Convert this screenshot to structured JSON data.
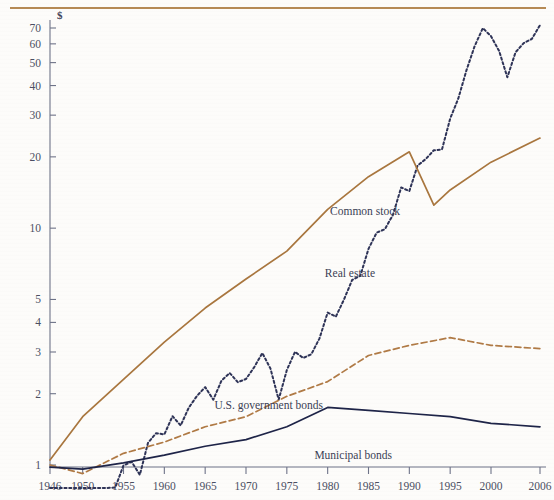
{
  "chart_data": {
    "type": "line",
    "title": "",
    "subtitle": "",
    "xlabel": "",
    "ylabel": "",
    "y_unit": "$",
    "yscale": "log",
    "ylim": [
      0.78,
      78
    ],
    "xlim": [
      1946,
      2006
    ],
    "grid": false,
    "legend_position": "inline-annotations",
    "ytick_labels": [
      "1",
      "2",
      "3",
      "4",
      "5",
      "10",
      "20",
      "30",
      "40",
      "50",
      "60",
      "70"
    ],
    "ytick_values": [
      1,
      2,
      3,
      4,
      5,
      10,
      20,
      30,
      40,
      50,
      60,
      70
    ],
    "xtick_labels": [
      "1946",
      "1950",
      "1955",
      "1960",
      "1965",
      "1970",
      "1975",
      "1980",
      "1985",
      "1990",
      "1995",
      "2000",
      "2006"
    ],
    "xtick_values": [
      1946,
      1950,
      1955,
      1960,
      1965,
      1970,
      1975,
      1980,
      1985,
      1990,
      1995,
      2000,
      2006
    ],
    "series": [
      {
        "name": "Common stock",
        "label": "Common stock",
        "color": "#2e3357",
        "style": "dotted",
        "x": [
          1946,
          1947,
          1948,
          1949,
          1950,
          1951,
          1952,
          1953,
          1954,
          1955,
          1956,
          1957,
          1958,
          1959,
          1960,
          1961,
          1962,
          1963,
          1964,
          1965,
          1966,
          1967,
          1968,
          1969,
          1970,
          1971,
          1972,
          1973,
          1974,
          1975,
          1976,
          1977,
          1978,
          1979,
          1980,
          1981,
          1982,
          1983,
          1984,
          1985,
          1986,
          1987,
          1988,
          1989,
          1990,
          1991,
          1992,
          1993,
          1994,
          1995,
          1996,
          1997,
          1998,
          1999,
          2000,
          2001,
          2002,
          2003,
          2004,
          2005,
          2006
        ],
        "y": [
          1.0,
          0.96,
          0.97,
          1.0,
          1.18,
          1.42,
          1.6,
          1.55,
          2.3,
          2.85,
          2.95,
          2.6,
          3.55,
          3.9,
          3.85,
          4.6,
          4.2,
          5.0,
          5.6,
          6.1,
          5.4,
          6.5,
          7.0,
          6.4,
          6.6,
          7.4,
          8.5,
          7.3,
          5.4,
          7.2,
          8.6,
          8.1,
          8.4,
          9.8,
          12.6,
          12.1,
          14.3,
          17.3,
          18.0,
          23.4,
          27.4,
          28.3,
          32.6,
          42.5,
          41.0,
          52.5,
          56.0,
          61.0,
          61.5,
          83.0,
          101.0,
          133.0,
          168.0,
          200.0,
          185.0,
          160.0,
          124.0,
          158.0,
          173.0,
          180.0,
          206.0
        ],
        "y_display_note": "plotted values re-scaled to chart: ends near 72"
      },
      {
        "name": "Real estate",
        "label": "Real estate",
        "color": "#a9763e",
        "style": "solid",
        "x": [
          1946,
          1950,
          1955,
          1960,
          1965,
          1970,
          1975,
          1980,
          1985,
          1990,
          1993,
          1995,
          2000,
          2006
        ],
        "y": [
          1.05,
          1.6,
          2.3,
          3.3,
          4.6,
          6.1,
          8.0,
          12.0,
          16.5,
          21.0,
          12.5,
          14.5,
          19.0,
          24.0
        ]
      },
      {
        "name": "U.S. government bonds",
        "label": "U.S. government bonds",
        "color": "#b07a45",
        "style": "dashed",
        "x": [
          1946,
          1950,
          1955,
          1960,
          1965,
          1970,
          1975,
          1980,
          1985,
          1990,
          1995,
          2000,
          2006
        ],
        "y": [
          1.0,
          0.92,
          1.12,
          1.25,
          1.45,
          1.6,
          1.95,
          2.25,
          2.9,
          3.2,
          3.45,
          3.2,
          3.1
        ]
      },
      {
        "name": "Municipal bonds",
        "label": "Municipal bonds",
        "color": "#1e2448",
        "style": "solid",
        "x": [
          1946,
          1950,
          1955,
          1960,
          1965,
          1970,
          1975,
          1980,
          1985,
          1990,
          1995,
          2000,
          2006
        ],
        "y": [
          0.98,
          0.96,
          1.02,
          1.1,
          1.2,
          1.28,
          1.45,
          1.75,
          1.7,
          1.65,
          1.6,
          1.5,
          1.45
        ]
      }
    ],
    "annotations": [
      {
        "text": "Common stock",
        "x_px": 400,
        "y_px": 215
      },
      {
        "text": "Real estate",
        "x_px": 375,
        "y_px": 277
      },
      {
        "text": "U.S. government bonds",
        "x_px": 323,
        "y_px": 409
      },
      {
        "text": "Municipal bonds",
        "x_px": 392,
        "y_px": 459
      }
    ]
  },
  "axis": {
    "unit_symbol": "$"
  },
  "colors": {
    "common_stock": "#2e3357",
    "real_estate": "#a9763e",
    "gov_bonds": "#b07a45",
    "muni_bonds": "#1e2448",
    "axis": "#6e7388",
    "rule": "#b08046",
    "background": "#fdfcfa"
  }
}
